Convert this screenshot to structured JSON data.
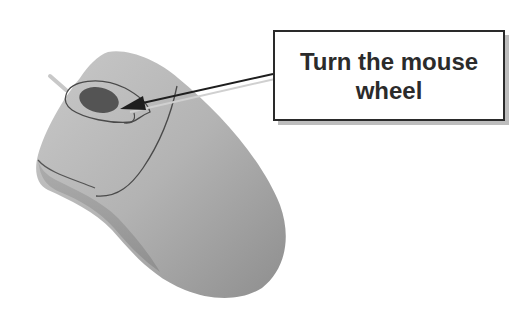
{
  "callout": {
    "text": "Turn the mouse wheel"
  },
  "illustration": {
    "subject": "computer-mouse",
    "highlight": "scroll-wheel",
    "colors": {
      "body": "#b8b8b8",
      "body_shadow": "#9a9a9a",
      "wheel": "#555555",
      "outline": "#3a3a3a",
      "arrow": "#1e1e1e",
      "callout_border": "#2a2a2a",
      "callout_shadow": "#bdbdbd"
    }
  }
}
